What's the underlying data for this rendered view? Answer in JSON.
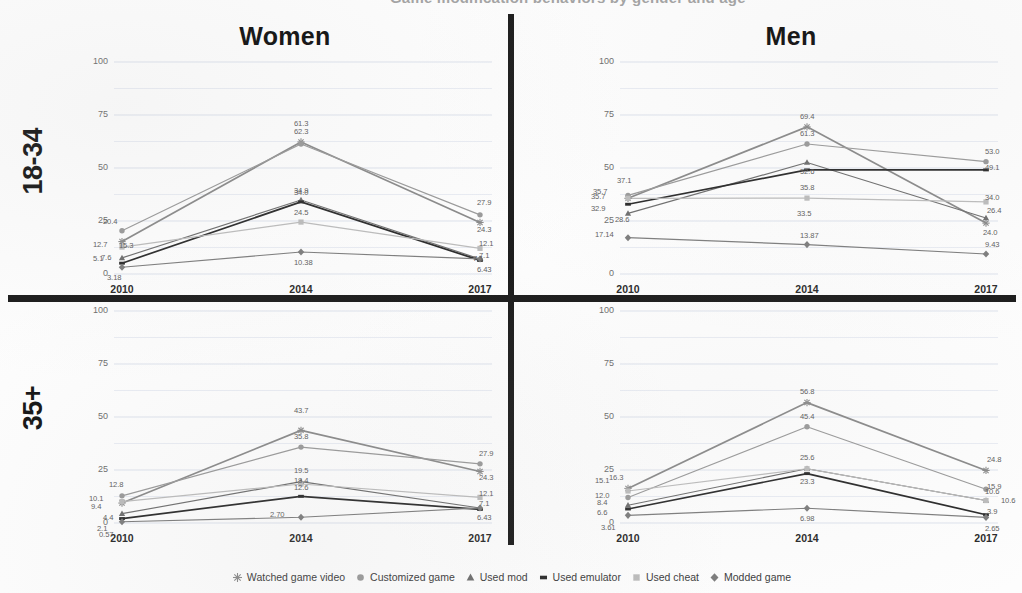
{
  "top_banner": {
    "text": "Game modification behaviors by gender and age"
  },
  "rows": [
    {
      "id": "18-34",
      "label": "18-34"
    },
    {
      "id": "35+",
      "label": "35+"
    }
  ],
  "columns": [
    {
      "id": "women",
      "title": "Women"
    },
    {
      "id": "men",
      "title": "Men"
    }
  ],
  "axis": {
    "y_ticks": [
      "100",
      "75",
      "50",
      "25",
      "0"
    ],
    "y_values": [
      100,
      75,
      50,
      25,
      0
    ],
    "y_min": 0,
    "y_max": 100,
    "x_ticks": [
      "2010",
      "2014",
      "2017"
    ],
    "grid": true
  },
  "legend": {
    "position": "bottom-center",
    "entries": [
      {
        "label": "Watched game video",
        "color": "#8a8a8a",
        "marker": "star"
      },
      {
        "label": "Customized game",
        "color": "#9a9a9a",
        "marker": "circle"
      },
      {
        "label": "Used mod",
        "color": "#6f6f6f",
        "marker": "triangle"
      },
      {
        "label": "Used emulator",
        "color": "#2b2b2b",
        "marker": "line"
      },
      {
        "label": "Used cheat",
        "color": "#bcbcbc",
        "marker": "square"
      },
      {
        "label": "Modded game",
        "color": "#7d7d7d",
        "marker": "diamond"
      }
    ]
  },
  "chart_data": [
    {
      "type": "line",
      "title": "Women",
      "panel": "Women 18-34",
      "row": "18-34",
      "column": "Women",
      "xlabel": "",
      "ylabel": "",
      "x": [
        "2010",
        "2014",
        "2017"
      ],
      "ylim": [
        0,
        100
      ],
      "series": [
        {
          "name": "Watched game video",
          "values": [
            15.3,
            62.3,
            24.3
          ],
          "labels": [
            "15.3",
            "62.3",
            "24.3"
          ],
          "color": "#8a8a8a"
        },
        {
          "name": "Customized game",
          "values": [
            20.4,
            61.3,
            27.9
          ],
          "labels": [
            "20.4",
            "61.3",
            "27.9"
          ],
          "color": "#9a9a9a"
        },
        {
          "name": "Used mod",
          "values": [
            7.6,
            34.9,
            7.1
          ],
          "labels": [
            "7.6",
            "34.9",
            "7.1"
          ],
          "color": "#6f6f6f"
        },
        {
          "name": "Used emulator",
          "values": [
            5.1,
            34.0,
            6.43
          ],
          "labels": [
            "5.1",
            "34.0",
            "6.43"
          ],
          "color": "#2b2b2b"
        },
        {
          "name": "Used cheat",
          "values": [
            12.7,
            24.5,
            12.1
          ],
          "labels": [
            "12.7",
            "24.5",
            "12.1"
          ],
          "color": "#bcbcbc"
        },
        {
          "name": "Modded game",
          "values": [
            3.18,
            10.38,
            7.1
          ],
          "labels": [
            "3.18",
            "10.38",
            "7.1"
          ],
          "color": "#7d7d7d"
        }
      ]
    },
    {
      "type": "line",
      "title": "Men",
      "panel": "Men 18-34",
      "row": "18-34",
      "column": "Men",
      "xlabel": "",
      "ylabel": "",
      "x": [
        "2010",
        "2014",
        "2017"
      ],
      "ylim": [
        0,
        100
      ],
      "series": [
        {
          "name": "Watched game video",
          "values": [
            35.7,
            69.4,
            24.0
          ],
          "labels": [
            "35.7",
            "69.4",
            "24.0"
          ],
          "color": "#8a8a8a"
        },
        {
          "name": "Customized game",
          "values": [
            37.1,
            61.3,
            53.0
          ],
          "labels": [
            "37.1",
            "61.3",
            "53.0"
          ],
          "color": "#9a9a9a"
        },
        {
          "name": "Used mod",
          "values": [
            28.6,
            52.6,
            26.4
          ],
          "labels": [
            "28.6",
            "52.6",
            "26.4"
          ],
          "color": "#6f6f6f"
        },
        {
          "name": "Used emulator",
          "values": [
            32.9,
            49.1,
            49.1
          ],
          "labels": [
            "32.9",
            "",
            "49.1"
          ],
          "color": "#2b2b2b"
        },
        {
          "name": "Used cheat",
          "values": [
            35.7,
            35.8,
            34.0
          ],
          "labels": [
            "35.7",
            "35.8",
            "34.0"
          ],
          "color": "#bcbcbc"
        },
        {
          "name": "Modded game",
          "values": [
            17.14,
            13.87,
            9.43
          ],
          "labels": [
            "17.14",
            "13.87",
            "9.43"
          ],
          "color": "#7d7d7d"
        }
      ],
      "extra_labels": [
        "33.5"
      ]
    },
    {
      "type": "line",
      "title": "",
      "panel": "Women 35+",
      "row": "35+",
      "column": "Women",
      "xlabel": "",
      "ylabel": "",
      "x": [
        "2010",
        "2014",
        "2017"
      ],
      "ylim": [
        0,
        100
      ],
      "series": [
        {
          "name": "Watched game video",
          "values": [
            9.4,
            43.7,
            24.3
          ],
          "labels": [
            "9.4",
            "43.7",
            "24.3"
          ],
          "color": "#8a8a8a"
        },
        {
          "name": "Customized game",
          "values": [
            12.8,
            35.8,
            27.9
          ],
          "labels": [
            "12.8",
            "35.8",
            "27.9"
          ],
          "color": "#9a9a9a"
        },
        {
          "name": "Used mod",
          "values": [
            4.4,
            19.5,
            7.1
          ],
          "labels": [
            "4.4",
            "19.5",
            "7.1"
          ],
          "color": "#6f6f6f"
        },
        {
          "name": "Used emulator",
          "values": [
            2.1,
            12.6,
            6.43
          ],
          "labels": [
            "2.1",
            "12.6",
            "6.43"
          ],
          "color": "#2b2b2b"
        },
        {
          "name": "Used cheat",
          "values": [
            10.1,
            18.4,
            12.1
          ],
          "labels": [
            "10.1",
            "18.4",
            "12.1"
          ],
          "color": "#bcbcbc"
        },
        {
          "name": "Modded game",
          "values": [
            0.57,
            2.7,
            7.1
          ],
          "labels": [
            "0.57",
            "2.70",
            ""
          ],
          "color": "#7d7d7d"
        }
      ]
    },
    {
      "type": "line",
      "title": "",
      "panel": "Men 35+",
      "row": "35+",
      "column": "Men",
      "xlabel": "",
      "ylabel": "",
      "x": [
        "2010",
        "2014",
        "2017"
      ],
      "ylim": [
        0,
        100
      ],
      "series": [
        {
          "name": "Watched game video",
          "values": [
            16.3,
            56.8,
            24.8
          ],
          "labels": [
            "16.3",
            "56.8",
            "24.8"
          ],
          "color": "#8a8a8a"
        },
        {
          "name": "Customized game",
          "values": [
            12.0,
            45.4,
            15.9
          ],
          "labels": [
            "12.0",
            "45.4",
            "15.9"
          ],
          "color": "#9a9a9a"
        },
        {
          "name": "Used mod",
          "values": [
            8.4,
            25.6,
            10.6
          ],
          "labels": [
            "8.4",
            "25.6",
            "10.6"
          ],
          "color": "#6f6f6f"
        },
        {
          "name": "Used emulator",
          "values": [
            6.6,
            23.3,
            3.9
          ],
          "labels": [
            "6.6",
            "23.3",
            "3.9"
          ],
          "color": "#2b2b2b"
        },
        {
          "name": "Used cheat",
          "values": [
            15.1,
            25.6,
            10.6
          ],
          "labels": [
            "15.1",
            "",
            "10.6"
          ],
          "color": "#bcbcbc"
        },
        {
          "name": "Modded game",
          "values": [
            3.61,
            6.98,
            2.65
          ],
          "labels": [
            "3.61",
            "6.98",
            "2.65"
          ],
          "color": "#7d7d7d"
        }
      ]
    }
  ]
}
